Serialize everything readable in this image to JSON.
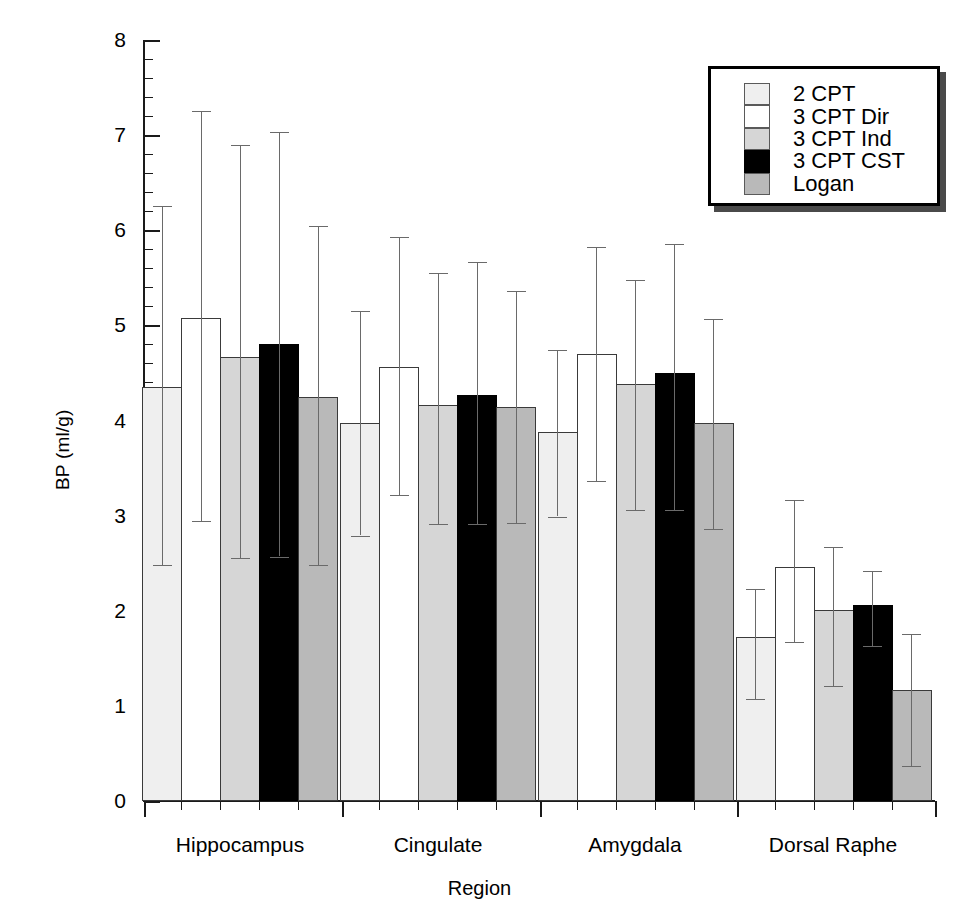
{
  "chart_data": {
    "type": "bar",
    "title": "",
    "xlabel": "Region",
    "ylabel": "BP (ml/g)",
    "ylim": [
      0,
      8
    ],
    "ytick_labels": [
      "0",
      "1",
      "2",
      "3",
      "4",
      "5",
      "6",
      "7",
      "8"
    ],
    "yticks": [
      0,
      1,
      2,
      3,
      4,
      5,
      6,
      7,
      8
    ],
    "minor_ticks_per_interval": 5,
    "grid": false,
    "legend_position": "top-right",
    "categories": [
      "Hippocampus",
      "Cingulate",
      "Amygdala",
      "Dorsal Raphe"
    ],
    "series": [
      {
        "name": "2 CPT",
        "fill": "very-light-gray",
        "color": "#efefef",
        "values": [
          4.35,
          3.97,
          3.88,
          1.72
        ],
        "err_upper": [
          6.26,
          5.15,
          4.74,
          2.23
        ],
        "err_lower": [
          2.48,
          2.79,
          2.99,
          1.07
        ]
      },
      {
        "name": "3 CPT Dir",
        "fill": "white",
        "color": "#ffffff",
        "values": [
          5.08,
          4.56,
          4.7,
          2.46
        ],
        "err_upper": [
          7.25,
          5.93,
          5.82,
          3.16
        ],
        "err_lower": [
          2.94,
          3.22,
          3.36,
          1.67
        ]
      },
      {
        "name": "3 CPT Ind",
        "fill": "light-gray",
        "color": "#d6d6d6",
        "values": [
          4.67,
          4.16,
          4.38,
          2.01
        ],
        "err_upper": [
          6.9,
          5.55,
          5.48,
          2.67
        ],
        "err_lower": [
          2.55,
          2.91,
          3.06,
          1.21
        ]
      },
      {
        "name": "3 CPT CST",
        "fill": "black",
        "color": "#000000",
        "values": [
          4.8,
          4.27,
          4.5,
          2.06
        ],
        "err_upper": [
          7.03,
          5.67,
          5.86,
          2.42
        ],
        "err_lower": [
          2.57,
          2.91,
          3.06,
          1.63
        ]
      },
      {
        "name": "Logan",
        "fill": "medium-gray",
        "color": "#b9b9b9",
        "values": [
          4.25,
          4.14,
          3.97,
          1.17
        ],
        "err_upper": [
          6.04,
          5.36,
          5.07,
          1.76
        ],
        "err_lower": [
          2.48,
          2.92,
          2.86,
          0.37
        ]
      }
    ]
  },
  "legend": {
    "items": [
      {
        "label": "2 CPT"
      },
      {
        "label": "3 CPT Dir"
      },
      {
        "label": "3 CPT Ind"
      },
      {
        "label": "3 CPT CST"
      },
      {
        "label": "Logan"
      }
    ]
  }
}
